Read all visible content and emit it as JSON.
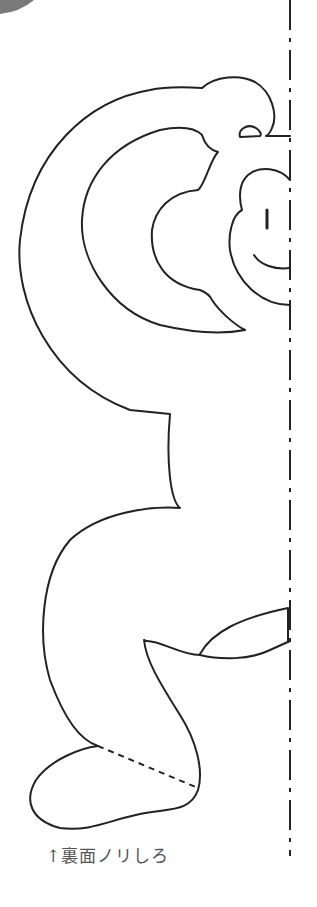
{
  "template": {
    "subject": "monkey cutout (half, mirrored on fold line)",
    "caption": "↑裏面ノリしろ",
    "colors": {
      "line": "#222222",
      "caption": "#555555",
      "corner_shape": "#7a7a7a",
      "background": "#ffffff"
    },
    "fold_line": {
      "style": "dash-dot",
      "x": 290
    }
  }
}
